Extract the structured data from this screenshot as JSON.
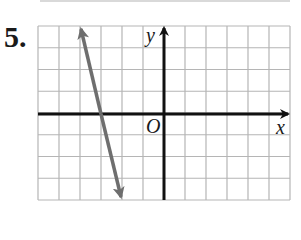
{
  "problem": {
    "number": "5."
  },
  "graph": {
    "axis_labels": {
      "x": "x",
      "y": "y",
      "origin": "O"
    },
    "grid": {
      "x_min": -6,
      "x_max": 6,
      "y_min": -4,
      "y_max": 4,
      "step": 1
    },
    "line": {
      "points": [
        [
          -4,
          4
        ],
        [
          -3,
          0
        ],
        [
          -2,
          -4
        ]
      ],
      "equation": "y = -4x - 12",
      "slope": -4,
      "x_intercept": -3,
      "arrows": "both",
      "color": "#6e6e6e"
    },
    "colors": {
      "grid": "#b5b5b5",
      "axis": "#111111",
      "line": "#6e6e6e"
    }
  }
}
